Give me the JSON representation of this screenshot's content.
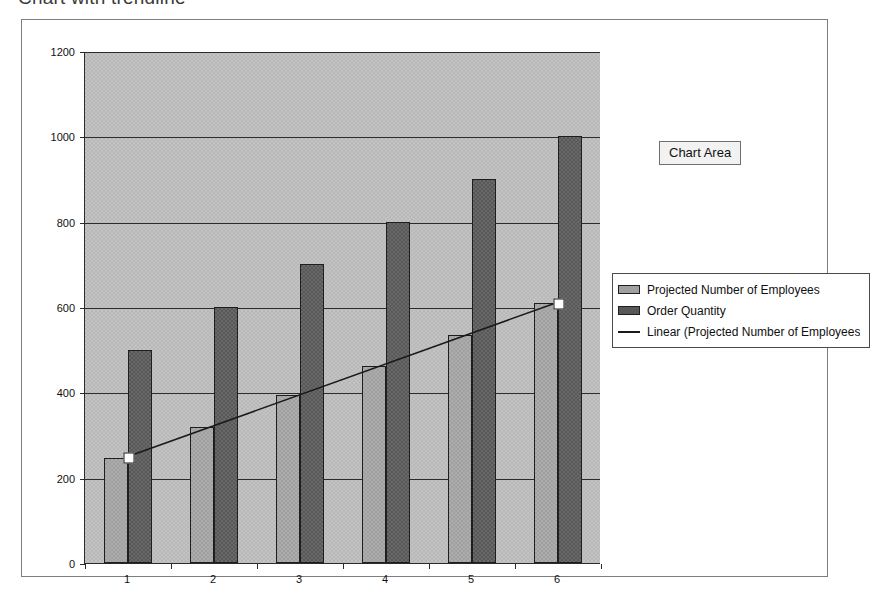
{
  "page": {
    "title": "Chart with trendline"
  },
  "tooltip": {
    "label": "Chart Area"
  },
  "legend": {
    "entries": [
      {
        "label": "Projected Number of Employees",
        "marker": "light-gray-square",
        "color": "#a0a0a0"
      },
      {
        "label": "Order Quantity",
        "marker": "dark-gray-square",
        "color": "#585858"
      },
      {
        "label": "Linear (Projected Number of Employees",
        "marker": "line",
        "color": "#1a1a1a"
      }
    ]
  },
  "colors": {
    "plot_background": "#b8b8b8",
    "series1": "#a0a0a0",
    "series2": "#585858",
    "trendline": "#1a1a1a",
    "axis": "#2b2b2b",
    "chart_background": "#ffffff"
  },
  "chart_data": {
    "type": "bar",
    "title": "Chart with trendline",
    "xlabel": "",
    "ylabel": "",
    "categories": [
      "1",
      "2",
      "3",
      "4",
      "5",
      "6"
    ],
    "ylim": [
      0,
      1200
    ],
    "ytick_values": [
      0,
      200,
      400,
      600,
      800,
      1000,
      1200
    ],
    "ytick_labels": [
      "0",
      "200",
      "400",
      "600",
      "800",
      "1000",
      "1200"
    ],
    "grid": true,
    "legend_position": "right",
    "series": [
      {
        "name": "Projected Number of Employees",
        "type": "bar",
        "color": "#a0a0a0",
        "values": [
          245,
          318,
          393,
          462,
          535,
          610
        ]
      },
      {
        "name": "Order Quantity",
        "type": "bar",
        "color": "#585858",
        "values": [
          500,
          600,
          700,
          800,
          900,
          1000
        ]
      },
      {
        "name": "Linear (Projected Number of Employees)",
        "type": "trendline",
        "color": "#1a1a1a",
        "endpoints": [
          {
            "category": "1",
            "value": 250
          },
          {
            "category": "6",
            "value": 612
          }
        ],
        "selected": true
      }
    ]
  }
}
